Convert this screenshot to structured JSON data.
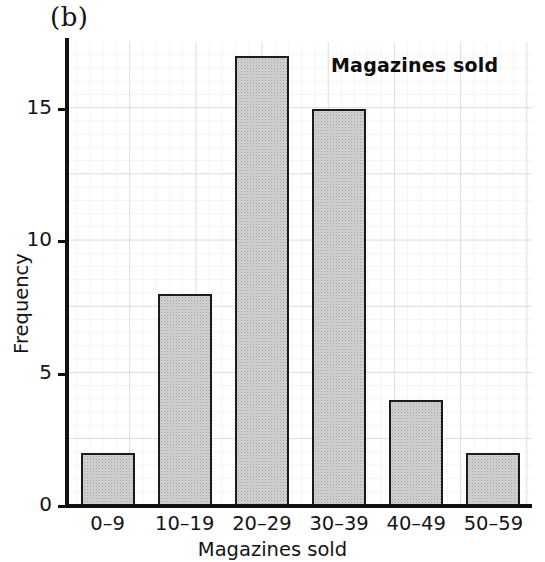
{
  "figure": {
    "panel_label": "(b)"
  },
  "chart_data": {
    "type": "bar",
    "title": "Magazines sold",
    "xlabel": "Magazines sold",
    "ylabel": "Frequency",
    "categories": [
      "0–9",
      "10–19",
      "20–29",
      "30–39",
      "40–49",
      "50–59"
    ],
    "values": [
      2,
      8,
      17,
      15,
      4,
      2
    ],
    "ylim": [
      0,
      18
    ],
    "yticks": [
      0,
      5,
      10,
      15
    ],
    "ytick_labels": [
      "0",
      "5",
      "10",
      "15"
    ],
    "grid": true,
    "legend": "none",
    "bar_fill_color": "#d2d2d2",
    "bar_border_color": "#1b1b1b",
    "grid_color": "#b2bac6",
    "axis_color": "#111111"
  }
}
